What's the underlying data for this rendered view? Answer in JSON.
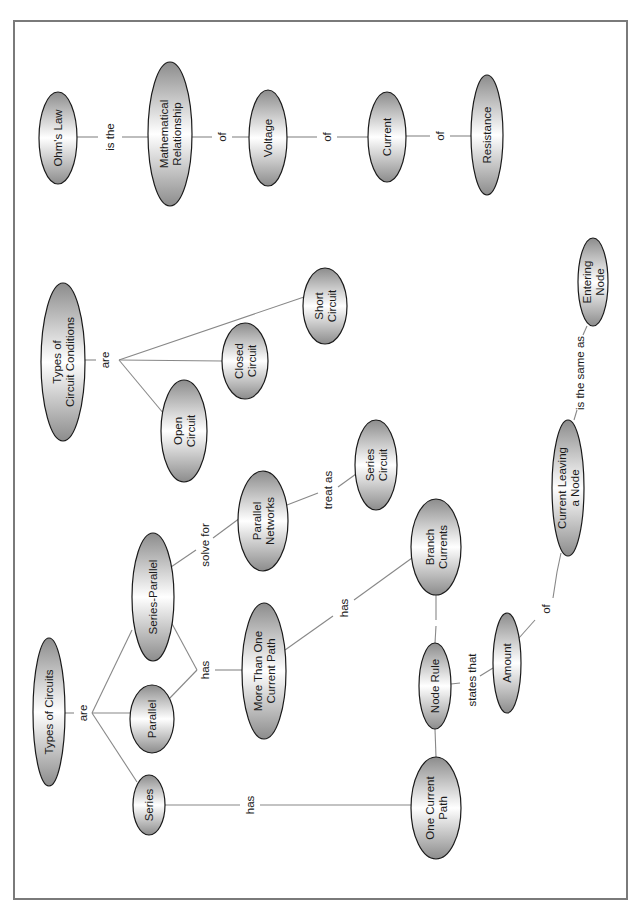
{
  "diagram": {
    "type": "concept-map",
    "orientation": "rotated-90-ccw",
    "colors": {
      "node_fill_end": "#8c8c8c",
      "node_fill_center": "#ffffff",
      "node_stroke": "#1a1a1a",
      "edge": "#888888",
      "frame": "#7a7a7a"
    },
    "nodes": [
      {
        "id": "ohms-law",
        "lines": [
          "Ohm's Law"
        ]
      },
      {
        "id": "math-relationship",
        "lines": [
          "Mathematical",
          "Relationship"
        ]
      },
      {
        "id": "voltage",
        "lines": [
          "Voltage"
        ]
      },
      {
        "id": "current",
        "lines": [
          "Current"
        ]
      },
      {
        "id": "resistance",
        "lines": [
          "Resistance"
        ]
      },
      {
        "id": "types-of-circuit-conditions",
        "lines": [
          "Types of",
          "Circuit Conditions"
        ]
      },
      {
        "id": "open-circuit",
        "lines": [
          "Open",
          "Circuit"
        ]
      },
      {
        "id": "closed-circuit",
        "lines": [
          "Closed",
          "Circuit"
        ]
      },
      {
        "id": "short-circuit",
        "lines": [
          "Short",
          "Circuit"
        ]
      },
      {
        "id": "types-of-circuits",
        "lines": [
          "Types of Circuits"
        ]
      },
      {
        "id": "series",
        "lines": [
          "Series"
        ]
      },
      {
        "id": "parallel",
        "lines": [
          "Parallel"
        ]
      },
      {
        "id": "series-parallel",
        "lines": [
          "Series-Parallel"
        ]
      },
      {
        "id": "more-than-one-current-path",
        "lines": [
          "More Than One",
          "Current Path"
        ]
      },
      {
        "id": "parallel-networks",
        "lines": [
          "Parallel",
          "Networks"
        ]
      },
      {
        "id": "series-circuit",
        "lines": [
          "Series",
          "Circuit"
        ]
      },
      {
        "id": "branch-currents",
        "lines": [
          "Branch",
          "Currents"
        ]
      },
      {
        "id": "one-current-path",
        "lines": [
          "One Current",
          "Path"
        ]
      },
      {
        "id": "node-rule",
        "lines": [
          "Node Rule"
        ]
      },
      {
        "id": "amount",
        "lines": [
          "Amount"
        ]
      },
      {
        "id": "current-leaving-a-node",
        "lines": [
          "Current Leaving",
          "a Node"
        ]
      },
      {
        "id": "entering-node",
        "lines": [
          "Entering",
          "Node"
        ]
      }
    ],
    "links": [
      {
        "id": "ohm-is-the",
        "label": "is the",
        "from": "ohms-law",
        "to": [
          "math-relationship"
        ]
      },
      {
        "id": "math-of",
        "label": "of",
        "from": "math-relationship",
        "to": [
          "voltage"
        ]
      },
      {
        "id": "voltage-of",
        "label": "of",
        "from": "voltage",
        "to": [
          "current"
        ]
      },
      {
        "id": "current-of",
        "label": "of",
        "from": "current",
        "to": [
          "resistance"
        ]
      },
      {
        "id": "conditions-are",
        "label": "are",
        "from": "types-of-circuit-conditions",
        "to": [
          "open-circuit",
          "closed-circuit",
          "short-circuit"
        ]
      },
      {
        "id": "circuits-are",
        "label": "are",
        "from": "types-of-circuits",
        "to": [
          "series",
          "parallel",
          "series-parallel"
        ]
      },
      {
        "id": "parallel-has",
        "label": "has",
        "from": "parallel",
        "also_from": "series-parallel",
        "to": [
          "more-than-one-current-path"
        ]
      },
      {
        "id": "sp-solve-for",
        "label": "solve for",
        "from": "series-parallel",
        "to": [
          "parallel-networks"
        ]
      },
      {
        "id": "pn-treat-as",
        "label": "treat as",
        "from": "parallel-networks",
        "to": [
          "series-circuit"
        ]
      },
      {
        "id": "mtocp-has",
        "label": "has",
        "from": "more-than-one-current-path",
        "to": [
          "branch-currents"
        ]
      },
      {
        "id": "series-has",
        "label": "has",
        "from": "series",
        "to": [
          "one-current-path"
        ]
      },
      {
        "id": "branch-node-rule",
        "label": "",
        "from": "branch-currents",
        "to": [
          "node-rule"
        ]
      },
      {
        "id": "ocp-node-rule",
        "label": "",
        "from": "one-current-path",
        "to": [
          "node-rule"
        ]
      },
      {
        "id": "nr-states-that",
        "label": "states that",
        "from": "node-rule",
        "to": [
          "amount"
        ]
      },
      {
        "id": "amount-of",
        "label": "of",
        "from": "amount",
        "to": [
          "current-leaving-a-node"
        ]
      },
      {
        "id": "cln-same-as",
        "label": "is the same as",
        "from": "current-leaving-a-node",
        "to": [
          "entering-node"
        ]
      }
    ]
  }
}
